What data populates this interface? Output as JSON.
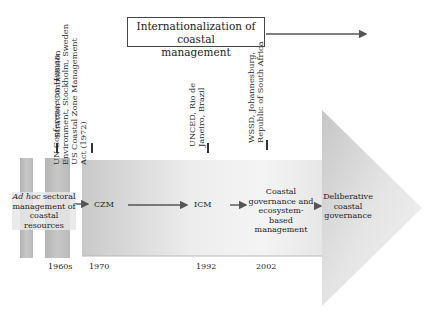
{
  "title_box": {
    "line1": "Internationalization of coastal",
    "line2": "management"
  },
  "events": [
    {
      "label_lines": [
        "Stratton Commission"
      ],
      "year": "1960s"
    },
    {
      "label_lines": [
        "UN Conference on Human",
        "Environment, Stockholm, Sweden",
        "US Coastal Zone Management",
        "Act (1972)"
      ],
      "year": "1970"
    },
    {
      "label_lines": [
        "UNCED, Rio de",
        "Janeiro, Brazil"
      ],
      "year": "1992"
    },
    {
      "label_lines": [
        "WSSD, Johannesburg,",
        "Republic of South Africa"
      ],
      "year": "2002"
    }
  ],
  "stages": {
    "adhoc": {
      "italic": "Ad hoc",
      "rest": " sectoral",
      "line2": "management of",
      "line3": "coastal resources"
    },
    "czm": "CZM",
    "icm": "ICM",
    "coastal_gov": [
      "Coastal",
      "governance and",
      "ecosystem-",
      "based management"
    ],
    "deliberative": [
      "Deliberative",
      "coastal",
      "governance"
    ]
  },
  "colors": {
    "arrow_dark": "#c4c4c4",
    "arrow_light": "#f4f4f4",
    "bar": "#bdbdbd",
    "line": "#555555"
  }
}
